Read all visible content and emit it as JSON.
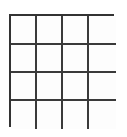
{
  "figure": {
    "kind": "grid-table",
    "title": "",
    "rows": 4,
    "columns": 4,
    "cell_count": 16,
    "cells_text": [
      [
        "",
        "",
        "",
        ""
      ],
      [
        "",
        "",
        "",
        ""
      ],
      [
        "",
        "",
        "",
        ""
      ],
      [
        "",
        "",
        "",
        ""
      ]
    ],
    "geometry": {
      "left_px": 9,
      "top_px": 14,
      "width_px": 105,
      "height_px": 113,
      "column_edges_px": [
        9,
        35,
        61,
        87,
        114
      ],
      "row_edges_px": [
        14,
        43,
        71,
        99,
        127
      ],
      "outer_line_width_px": 2,
      "inner_line_width_px": 2
    },
    "colors": {
      "page_background": "#ffffff",
      "figure_background": "#fdfdfd",
      "line_color": "#3a3a3a",
      "outer_line_color": "#333333"
    }
  }
}
